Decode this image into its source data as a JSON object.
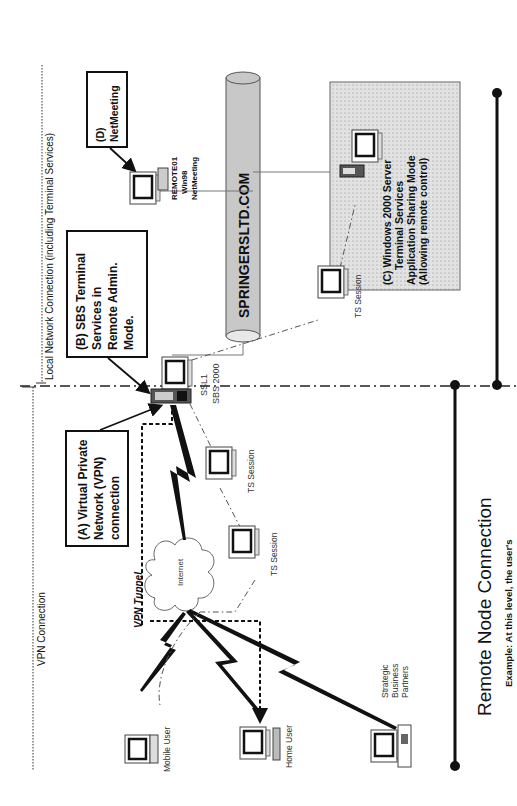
{
  "orientation": "rotated-90-ccw",
  "regions": {
    "local": {
      "label": "Local Network Connection (including Terminal Services)"
    },
    "vpn": {
      "label": "VPN Connection"
    }
  },
  "callouts": {
    "a": {
      "lines": [
        "(A) Virtual Private",
        "Network (VPN)",
        "connection"
      ]
    },
    "b": {
      "lines": [
        "(B) SBS Terminal",
        "Services in",
        "Remote Admin.",
        "Mode."
      ]
    },
    "c": {
      "lines": [
        "(C) Windows 2000 Server",
        "Terminal Services",
        "Application Sharing Mode",
        "(Allowing remote control)"
      ]
    },
    "d": {
      "lines": [
        "(D)",
        "NetMeeting"
      ]
    }
  },
  "nodes": {
    "domain": {
      "label": "SPRINGERSLTD.COM"
    },
    "server": {
      "lines": [
        "SSL1",
        "SBS 2000"
      ]
    },
    "remote01": {
      "lines": [
        "REMOTE01",
        "Win98",
        "NetMeeting"
      ]
    },
    "internet": {
      "label": "Internet"
    },
    "vpn_tunnel": {
      "label": "VPN Tunnel"
    },
    "ts_session_1": {
      "label": "TS Session"
    },
    "ts_session_2": {
      "label": "TS Session"
    },
    "ts_session_3": {
      "label": "TS Session"
    },
    "mobile_user": {
      "label": "Mobile User"
    },
    "home_user": {
      "label": "Home User"
    },
    "partners": {
      "lines": [
        "Strategic",
        "Business",
        "Partners"
      ]
    }
  },
  "footer": {
    "title": "Remote Node Connection",
    "caption": "Example: At this level, the user's"
  },
  "colors": {
    "ink": "#111111",
    "cylinder_fill": "#c8c8c8",
    "shaded_box_fill": "#d9d9d9",
    "line_gray": "#777777"
  }
}
